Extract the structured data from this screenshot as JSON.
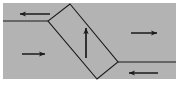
{
  "diagram": {
    "title": "Reverse fault block diagram",
    "type": "geological-fault-cross-section",
    "canvas": {
      "width": 181,
      "height": 96,
      "background": "#ffffff"
    },
    "colors": {
      "rock_fill": "#b3b3b3",
      "block_fill": "#b3b3b3",
      "line": "#1a1a1a",
      "background": "#ffffff"
    },
    "rock_mass": {
      "label": "rock-mass",
      "x": 3,
      "y": 3,
      "width": 173,
      "height": 76
    },
    "fault_block": {
      "label": "fault-block",
      "points": "70,4 118,62 97,79 48,21",
      "dip_direction": "down-to-the-right",
      "dip_angle_deg": 50
    },
    "fault_lines": [
      {
        "name": "upper-left-fault-trace",
        "x1": 3,
        "y1": 21,
        "x2": 48,
        "y2": 21
      },
      {
        "name": "lower-right-fault-trace",
        "x1": 118,
        "y1": 62,
        "x2": 176,
        "y2": 62
      }
    ],
    "arrows": [
      {
        "name": "compression-arrow-top-left",
        "direction": "left",
        "meaning": "compression",
        "x1": 50,
        "y1": 14,
        "x2": 18,
        "y2": 14
      },
      {
        "name": "compression-arrow-mid-left",
        "direction": "right",
        "meaning": "compression",
        "x1": 22,
        "y1": 54,
        "x2": 47,
        "y2": 54
      },
      {
        "name": "block-uplift-arrow",
        "direction": "up",
        "meaning": "hanging-wall-uplift",
        "x1": 86,
        "y1": 58,
        "x2": 86,
        "y2": 26
      },
      {
        "name": "compression-arrow-top-right",
        "direction": "right",
        "meaning": "compression",
        "x1": 131,
        "y1": 33,
        "x2": 159,
        "y2": 33
      },
      {
        "name": "compression-arrow-bottom-right",
        "direction": "left",
        "meaning": "compression",
        "x1": 158,
        "y1": 73,
        "x2": 127,
        "y2": 73
      }
    ]
  }
}
